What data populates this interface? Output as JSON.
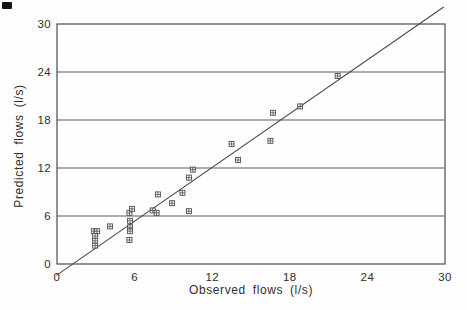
{
  "chart_data": {
    "type": "scatter",
    "title": "",
    "xlabel": "Observed flows (l/s)",
    "ylabel": "Predicted flows (l/s)",
    "xlim": [
      0,
      30
    ],
    "ylim": [
      0,
      30
    ],
    "x_ticks": [
      0,
      6,
      12,
      18,
      24,
      30
    ],
    "y_ticks": [
      0,
      6,
      12,
      18,
      24,
      30
    ],
    "grid": "horizontal-only",
    "legend": "none",
    "marker": "open-square-with-cross",
    "points": [
      [
        2.85,
        4.1
      ],
      [
        3.1,
        4.1
      ],
      [
        2.95,
        3.5
      ],
      [
        2.95,
        2.9
      ],
      [
        2.95,
        2.3
      ],
      [
        4.1,
        4.7
      ],
      [
        5.6,
        6.4
      ],
      [
        5.8,
        6.9
      ],
      [
        5.65,
        5.4
      ],
      [
        5.65,
        4.6
      ],
      [
        5.65,
        4.1
      ],
      [
        5.6,
        3.0
      ],
      [
        7.4,
        6.7
      ],
      [
        7.7,
        6.4
      ],
      [
        7.8,
        8.7
      ],
      [
        8.9,
        7.6
      ],
      [
        9.7,
        8.9
      ],
      [
        10.2,
        10.8
      ],
      [
        10.5,
        11.8
      ],
      [
        10.2,
        6.6
      ],
      [
        13.5,
        15.0
      ],
      [
        14.0,
        13.0
      ],
      [
        16.5,
        15.4
      ],
      [
        16.7,
        18.9
      ],
      [
        18.8,
        19.7
      ],
      [
        21.7,
        23.5
      ]
    ],
    "fit_line": {
      "slope": 1.12,
      "intercept": -1.36,
      "x_start": -0.05,
      "x_end": 29.9,
      "note": "best-fit line drawn slightly beyond plot frame"
    },
    "colors": {
      "frame": "#4d4d4d",
      "grid": "#4d4d4d",
      "line": "#4a4a4a",
      "marker": "#4f4f4f",
      "text": "#2f2f2f",
      "background": "#fefefe"
    }
  }
}
